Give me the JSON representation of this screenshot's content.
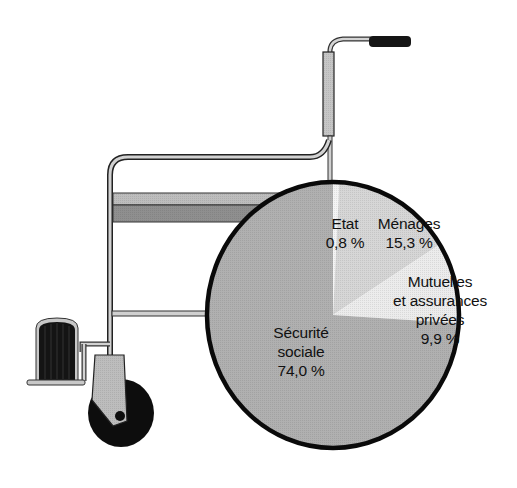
{
  "chart_data": {
    "type": "pie",
    "title": "",
    "start_angle_deg": 0,
    "direction": "clockwise",
    "slices": [
      {
        "name": "Etat",
        "label_lines": [
          "Etat",
          "0,8 %"
        ],
        "value": 0.8,
        "value_label": "0,8 %",
        "color": "#f4f4f4"
      },
      {
        "name": "Ménages",
        "label_lines": [
          "Ménages",
          "15,3 %"
        ],
        "value": 15.3,
        "value_label": "15,3 %",
        "color": "#d6d6d6"
      },
      {
        "name": "Mutuelles et assurances privées",
        "label_lines": [
          "Mutuelles",
          "et assurances",
          "privées",
          "9,9 %"
        ],
        "value": 9.9,
        "value_label": "9,9 %",
        "color": "#ececec"
      },
      {
        "name": "Sécurité sociale",
        "label_lines": [
          "Sécurité",
          "sociale",
          "74,0 %"
        ],
        "value": 74.0,
        "value_label": "74,0 %",
        "color": "#b0b0b0"
      }
    ],
    "categories": [
      "Etat",
      "Ménages",
      "Mutuelles et assurances privées",
      "Sécurité sociale"
    ],
    "values": [
      0.8,
      15.3,
      9.9,
      74.0
    ],
    "decoration": "pie drawn as the rear wheel of a wheelchair illustration",
    "legend": "none (labels placed inside slices)"
  },
  "labels": {
    "etat": {
      "line1": "Etat",
      "line2": "0,8 %"
    },
    "menages": {
      "line1": "Ménages",
      "line2": "15,3 %"
    },
    "mutuelles": {
      "line1": "Mutuelles",
      "line2": "et assurances",
      "line3": "privées",
      "line4": "9,9 %"
    },
    "secu": {
      "line1": "Sécurité",
      "line2": "sociale",
      "line3": "74,0 %"
    }
  },
  "colors": {
    "outline": "#111111",
    "frame_fill": "#c8c8c8",
    "seat_top": "#b8b8b8",
    "seat_bottom": "#8e8e8e",
    "footrest": "#1a1a1a",
    "wheel": "#0d0d0d",
    "fork": "#bdbdbd"
  }
}
